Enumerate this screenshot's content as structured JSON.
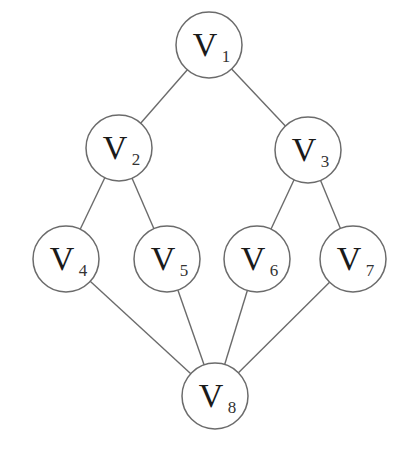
{
  "diagram": {
    "type": "graph",
    "directed": false,
    "nodes": [
      {
        "id": "V1",
        "letter": "V",
        "sub": "1",
        "x": 209,
        "y": 45
      },
      {
        "id": "V2",
        "letter": "V",
        "sub": "2",
        "x": 119,
        "y": 148
      },
      {
        "id": "V3",
        "letter": "V",
        "sub": "3",
        "x": 308,
        "y": 150
      },
      {
        "id": "V4",
        "letter": "V",
        "sub": "4",
        "x": 66,
        "y": 259
      },
      {
        "id": "V5",
        "letter": "V",
        "sub": "5",
        "x": 167,
        "y": 259
      },
      {
        "id": "V6",
        "letter": "V",
        "sub": "6",
        "x": 257,
        "y": 259
      },
      {
        "id": "V7",
        "letter": "V",
        "sub": "7",
        "x": 353,
        "y": 259
      },
      {
        "id": "V8",
        "letter": "V",
        "sub": "8",
        "x": 215,
        "y": 396
      }
    ],
    "edges": [
      [
        "V1",
        "V2"
      ],
      [
        "V1",
        "V3"
      ],
      [
        "V2",
        "V4"
      ],
      [
        "V2",
        "V5"
      ],
      [
        "V3",
        "V6"
      ],
      [
        "V3",
        "V7"
      ],
      [
        "V4",
        "V8"
      ],
      [
        "V5",
        "V8"
      ],
      [
        "V6",
        "V8"
      ],
      [
        "V7",
        "V8"
      ]
    ],
    "node_radius": 33,
    "colors": {
      "stroke": "#6b6b6b",
      "fill": "#ffffff",
      "text": "#1a1a1a"
    }
  }
}
